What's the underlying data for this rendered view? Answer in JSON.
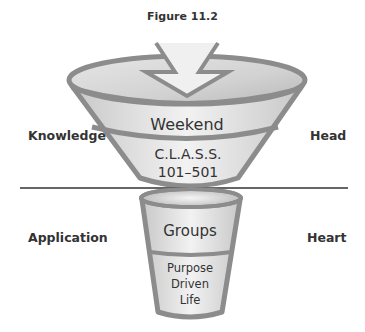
{
  "figure": {
    "title": "Figure 11.2"
  },
  "side_labels": {
    "left_top": "Knowledge",
    "right_top": "Head",
    "left_bottom": "Application",
    "right_bottom": "Heart"
  },
  "upper_funnel": {
    "bands": [
      {
        "label": "Weekend"
      },
      {
        "label_line1": "C.L.A.S.S.",
        "label_line2": "101–501"
      }
    ]
  },
  "lower_funnel": {
    "bands": [
      {
        "label": "Groups"
      },
      {
        "label_line1": "Purpose",
        "label_line2": "Driven",
        "label_line3": "Life"
      }
    ]
  },
  "colors": {
    "outline": "#8c8c8c",
    "fill_light": "#ececec",
    "fill_dark": "#c4c4c4",
    "divider_line": "#333333"
  }
}
